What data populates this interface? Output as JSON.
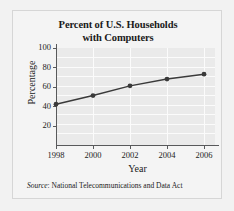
{
  "figure": {
    "title_line1": "Percent of U.S. Households",
    "title_line2": "with Computers",
    "source_prefix": "Source",
    "source_text": ": National Telecommunications and Data Act",
    "background_color": "#f4f4f4",
    "plot_background_color": "#eaeaea",
    "grid_color": "#fbfbfb",
    "axis_color": "#58595b",
    "series_color": "#3a3a3a"
  },
  "chart_data": {
    "type": "line",
    "title": "Percent of U.S. Households with Computers",
    "xlabel": "Year",
    "ylabel": "Percentage",
    "x": [
      1998,
      2000,
      2002,
      2004,
      2006
    ],
    "values": [
      42,
      51,
      61,
      68,
      73
    ],
    "series": [
      {
        "name": "Percent of U.S. households with computers",
        "values": [
          42,
          51,
          61,
          68,
          73
        ]
      }
    ],
    "xlim": [
      1997,
      2007
    ],
    "ylim": [
      0,
      100
    ],
    "xticks": [
      1998,
      2000,
      2002,
      2004,
      2006
    ],
    "xticklabels": [
      "1998",
      "2000",
      "2002",
      "2004",
      "2006"
    ],
    "yticks": [
      20,
      40,
      60,
      80,
      100
    ],
    "yticklabels": [
      "20",
      "40",
      "60",
      "80",
      "100"
    ],
    "grid": true,
    "grid_axis": "both",
    "minor_grid_step": 10,
    "legend": false,
    "markers": "circle",
    "annotation": "Source: National Telecommunications and Data Act"
  }
}
